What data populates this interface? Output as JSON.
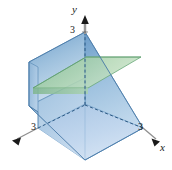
{
  "figure": {
    "kind": "3d-solid-with-cross-section",
    "background": "#ffffff",
    "axes": {
      "origin": [
        85,
        105
      ],
      "items": [
        {
          "name": "y",
          "label": "y",
          "direction": "up",
          "tip": [
            85,
            18
          ],
          "arrow": true,
          "tick": {
            "value": "3",
            "point": [
              85,
              32
            ]
          }
        },
        {
          "name": "x",
          "label": "x",
          "direction": "lower-right",
          "tip": [
            160,
            140
          ],
          "arrow": true,
          "tick": {
            "value": "3",
            "point": [
              143,
              128
            ]
          }
        },
        {
          "name": "z",
          "label": "",
          "direction": "lower-left",
          "tip": [
            12,
            141
          ],
          "arrow": true,
          "tick": {
            "value": "3",
            "point": [
              38,
              128
            ]
          }
        }
      ]
    },
    "colors": {
      "solid_top_slant": "#7ba7d0",
      "solid_top_slant_light": "#c3d9ec",
      "solid_right_face": "#8fb6da",
      "solid_right_face_light": "#cfe0f0",
      "solid_left_face": "#9dc0de",
      "solid_bottom_face": "#b7cfe8",
      "solid_back_face": "#a8c5e2",
      "cross_section_green": "#9ecba3",
      "cross_section_green_light": "#c8e3c6",
      "edge_solid": "#4a7aa8",
      "edge_dashed": "#2d4f72",
      "axis_line": "#a8a8a8",
      "axis_ink": "#1a1a1a"
    },
    "geometry": {
      "vertices": {
        "origin": [
          85,
          105
        ],
        "top_back": [
          85,
          32
        ],
        "top_left": [
          29,
          62
        ],
        "left_back": [
          29,
          62
        ],
        "left_front_top": [
          29,
          62
        ],
        "left_bottom": [
          29,
          128
        ],
        "front_bottom": [
          85,
          160
        ],
        "right_bottom": [
          143,
          128
        ],
        "left_lower": [
          38,
          128
        ],
        "ridge_front": [
          29,
          105
        ]
      },
      "cross_section": {
        "description": "green parallelogram slice through the solid",
        "points": [
          [
            33,
            87
          ],
          [
            86,
            57
          ],
          [
            142,
            57
          ],
          [
            88,
            88
          ]
        ]
      }
    }
  },
  "paths": {
    "axis_y": "M85,105 L85,20",
    "axis_x": "M85,105 L156,140",
    "axis_z": "M85,105 L16,139",
    "solid_top_face": "M85,32 L29,62 L29,105 L85,78 Z",
    "solid_left_vertical": "M29,62 L29,128 L38,133 L38,67 Z",
    "solid_right_slant": "M85,32 L143,128 L85,160 L85,32 Z",
    "solid_bottom": "M38,128 L85,160 L143,128 L85,104 Z",
    "solid_front_slant": "M29,105 L85,160 L85,78 Z",
    "edge_ridge": "M85,32 L29,62",
    "edge_front": "M29,105 L85,160",
    "edge_right": "M143,128 L85,160",
    "dash_base_left": "M38,128 L85,105",
    "dash_base_right": "M85,105 L143,128"
  },
  "meta": {
    "ticks": {
      "y": "3",
      "x": "3",
      "z": "3"
    },
    "axis_labels": {
      "x": "x",
      "y": "y"
    }
  }
}
